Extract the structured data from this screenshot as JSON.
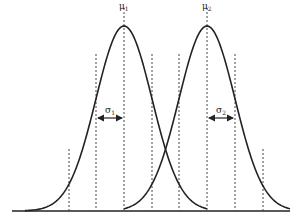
{
  "figure": {
    "title": "",
    "line_color": "#222222",
    "dash_color": "#444444",
    "background": "#ffffff"
  },
  "chart_data": {
    "type": "line",
    "title": "",
    "xlabel": "",
    "ylabel": "",
    "grid": false,
    "legend": null,
    "series": [
      {
        "name": "Gaussian 1",
        "mean_label": "μ1",
        "sigma_label": "σ1",
        "mean": 0,
        "sigma": 1
      },
      {
        "name": "Gaussian 2",
        "mean_label": "μ2",
        "sigma_label": "σ2",
        "mean": 3,
        "sigma": 1
      }
    ],
    "annotations": [
      {
        "text": "μ1",
        "type": "mean-marker",
        "series": 0
      },
      {
        "text": "μ2",
        "type": "mean-marker",
        "series": 1
      },
      {
        "text": "σ1",
        "type": "sigma-arrow",
        "series": 0
      },
      {
        "text": "σ2",
        "type": "sigma-arrow",
        "series": 1
      }
    ],
    "vertical_guides_sigma": [
      -2,
      -1,
      0,
      1,
      2,
      3,
      4,
      5
    ]
  },
  "labels": {
    "mu1": "μ",
    "mu1_sub": "1",
    "mu2": "μ",
    "mu2_sub": "2",
    "sigma1": "σ",
    "sigma1_sub": "1",
    "sigma2": "σ",
    "sigma2_sub": "2"
  }
}
